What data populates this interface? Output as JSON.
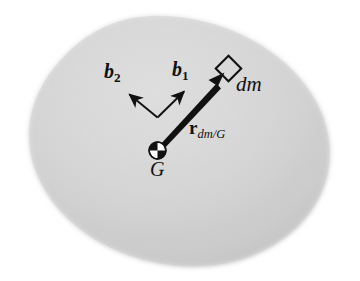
{
  "figure": {
    "kind": "rigid-body-mass-element-diagram",
    "background_color": "#ffffff",
    "body": {
      "name": "rigid-body-blob",
      "fill_light": "#e9e9e9",
      "fill_mid": "#cfcfcf",
      "fill_dark": "#a8a8a8",
      "edge_softness": "blurred"
    },
    "labels": {
      "b2_base": "b",
      "b2_sub": "2",
      "b1_base": "b",
      "b1_sub": "1",
      "dm": "dm",
      "G": "G",
      "r_base": "r",
      "r_sub": "dm/G"
    },
    "markers": {
      "center_of_mass_symbol": "quartered-circle",
      "mass_element_symbol": "open-diamond"
    },
    "vectors": [
      {
        "name": "r_dm_G",
        "from": "G",
        "to": "dm",
        "style": "thick-tapered-arrow",
        "color": "#111111"
      },
      {
        "name": "b1",
        "from": "frame-origin",
        "direction": "up-right",
        "style": "thin-arrow",
        "color": "#111111"
      },
      {
        "name": "b2",
        "from": "frame-origin",
        "direction": "up-left",
        "style": "thin-arrow",
        "color": "#111111"
      }
    ]
  }
}
